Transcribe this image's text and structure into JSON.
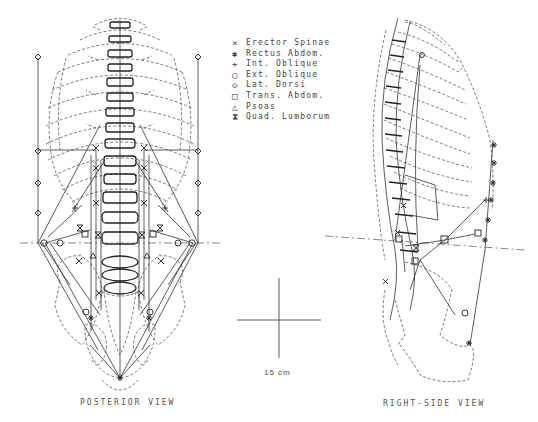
{
  "legend": {
    "items": [
      {
        "symbol": "×",
        "icon": "x-marker",
        "label": "Erector Spinae"
      },
      {
        "symbol": "✱",
        "icon": "asterisk-marker",
        "label": "Rectus Abdom."
      },
      {
        "symbol": "+",
        "icon": "plus-marker",
        "label": "Int. Oblique"
      },
      {
        "symbol": "○",
        "icon": "circle-marker",
        "label": "Ext. Oblique"
      },
      {
        "symbol": "◇",
        "icon": "diamond-marker",
        "label": "Lat. Dorsi"
      },
      {
        "symbol": "□",
        "icon": "square-marker",
        "label": "Trans. Abdom."
      },
      {
        "symbol": "△",
        "icon": "triangle-marker",
        "label": "Psoas"
      },
      {
        "symbol": "⧗",
        "icon": "hourglass-marker",
        "label": "Quad. Lumborum"
      }
    ]
  },
  "views": {
    "posterior": {
      "caption": "POSTERIOR VIEW"
    },
    "right_side": {
      "caption": "RIGHT-SIDE VIEW"
    }
  },
  "scale": {
    "label": "15 cm"
  }
}
